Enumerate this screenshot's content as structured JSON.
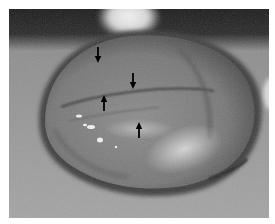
{
  "figure": {
    "kind": "clinical photograph (grayscale)",
    "description": "Large translucent membranous sac with black arrows indicating a linear fold/membrane line across its surface",
    "colors": {
      "background_border": "#ffffff",
      "top_dark_region": "#1e1e1e",
      "top_highlight": "#e6e6e6",
      "skin_surface": "#9a9a9a",
      "sac_body": "#7c7c7c",
      "sac_rim": "#3c3c3c",
      "arrow": "#000000"
    },
    "arrows": [
      {
        "id": 1,
        "direction": "down",
        "x": 89,
        "y_tail": 38,
        "y_head": 54
      },
      {
        "id": 2,
        "direction": "down",
        "x": 124,
        "y_tail": 64,
        "y_head": 80
      },
      {
        "id": 3,
        "direction": "up",
        "x": 95,
        "y_tail": 102,
        "y_head": 86
      },
      {
        "id": 4,
        "direction": "up",
        "x": 130,
        "y_tail": 129,
        "y_head": 113
      }
    ]
  }
}
